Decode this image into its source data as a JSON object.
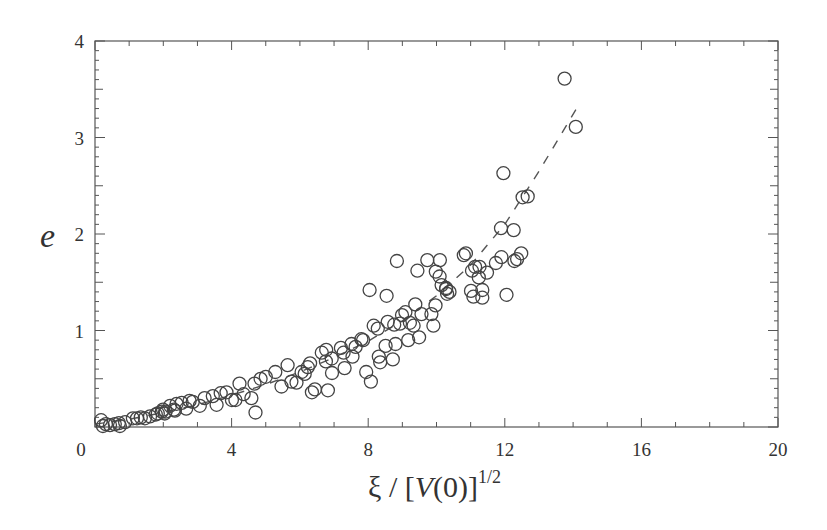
{
  "chart_data": {
    "type": "scatter",
    "title": "",
    "xlabel": "ξ / [V(0)]^{1/2}",
    "ylabel": "e",
    "xlim": [
      0,
      20
    ],
    "ylim": [
      0,
      4
    ],
    "xticks": [
      0,
      4,
      8,
      12,
      16,
      20
    ],
    "yticks": [
      1,
      2,
      3,
      4
    ],
    "ytick_labels": [
      "1",
      "2",
      "3",
      "4"
    ],
    "xtick_labels": [
      "0",
      "4",
      "8",
      "12",
      "16",
      "20"
    ],
    "grid": false,
    "legend": null,
    "series": [
      {
        "name": "data",
        "marker": "open-circle",
        "color": "#444444",
        "x": [
          0.18,
          0.23,
          0.32,
          0.44,
          0.58,
          0.7,
          0.73,
          0.88,
          1.11,
          1.23,
          1.34,
          1.46,
          1.61,
          1.78,
          1.96,
          2.04,
          2.07,
          2.34,
          1.84,
          1.99,
          2.31,
          2.2,
          2.39,
          2.54,
          2.67,
          2.77,
          2.86,
          3.07,
          3.21,
          3.45,
          3.56,
          3.68,
          3.85,
          4.01,
          4.11,
          4.23,
          4.35,
          4.67,
          4.58,
          4.85,
          4.7,
          5.0,
          5.28,
          5.46,
          5.64,
          5.9,
          5.75,
          6.05,
          6.23,
          6.14,
          6.3,
          6.76,
          6.64,
          6.93,
          6.44,
          6.35,
          7.31,
          7.54,
          7.28,
          6.77,
          7.2,
          6.94,
          6.82,
          7.51,
          7.63,
          7.8,
          7.94,
          8.28,
          8.31,
          7.85,
          8.08,
          8.8,
          8.57,
          8.76,
          9.22,
          8.99,
          9.33,
          9.09,
          9.17,
          8.93,
          9.91,
          9.38,
          9.85,
          9.56,
          9.97,
          10.38,
          10.15,
          10.28,
          10.09,
          10.1,
          10.8,
          11.04,
          11.13,
          11.34,
          11.24,
          11.26,
          11.74,
          11.34,
          11.89,
          11.96,
          12.52,
          12.28,
          12.48,
          11.9,
          12.26,
          12.67,
          13.75,
          14.08,
          8.54,
          8.04,
          8.16,
          9.44,
          9.73,
          8.51,
          8.35,
          8.72,
          9.49,
          8.84,
          10.86,
          11.01,
          11.48,
          11.08,
          10.31,
          9.98,
          10.28,
          12.05,
          12.36
        ],
        "y": [
          0.07,
          0.01,
          0.03,
          0.02,
          0.03,
          0.04,
          0.01,
          0.05,
          0.09,
          0.09,
          0.1,
          0.09,
          0.11,
          0.13,
          0.16,
          0.14,
          0.16,
          0.17,
          0.14,
          0.18,
          0.18,
          0.22,
          0.24,
          0.25,
          0.19,
          0.27,
          0.26,
          0.22,
          0.3,
          0.32,
          0.23,
          0.35,
          0.36,
          0.28,
          0.28,
          0.45,
          0.34,
          0.45,
          0.3,
          0.5,
          0.15,
          0.52,
          0.57,
          0.42,
          0.64,
          0.46,
          0.47,
          0.57,
          0.62,
          0.55,
          0.66,
          0.68,
          0.77,
          0.71,
          0.39,
          0.36,
          0.61,
          0.73,
          0.77,
          0.8,
          0.82,
          0.56,
          0.38,
          0.86,
          0.83,
          0.91,
          0.57,
          1.02,
          0.73,
          0.9,
          0.47,
          0.86,
          1.09,
          1.06,
          1.08,
          1.16,
          1.05,
          1.19,
          0.9,
          1.07,
          1.05,
          1.27,
          1.17,
          1.17,
          1.26,
          1.4,
          1.47,
          1.43,
          1.56,
          1.73,
          1.78,
          1.62,
          1.66,
          1.42,
          1.55,
          1.66,
          1.7,
          1.34,
          2.06,
          2.63,
          2.38,
          1.72,
          1.8,
          1.76,
          2.04,
          2.39,
          3.61,
          3.11,
          1.36,
          1.42,
          1.05,
          1.62,
          1.73,
          0.84,
          0.67,
          0.7,
          0.93,
          1.72,
          1.8,
          1.41,
          1.6,
          1.35,
          1.38,
          1.61,
          1.44,
          1.37,
          1.74
        ]
      },
      {
        "name": "fit",
        "style": "dashed",
        "color": "#555555",
        "x": [
          0,
          1,
          2,
          3,
          4,
          5,
          6,
          7,
          8,
          9,
          10,
          11,
          12,
          13,
          14.1
        ],
        "y": [
          0.03,
          0.08,
          0.15,
          0.23,
          0.33,
          0.44,
          0.57,
          0.72,
          0.89,
          1.1,
          1.36,
          1.68,
          2.1,
          2.65,
          3.3
        ]
      }
    ]
  }
}
